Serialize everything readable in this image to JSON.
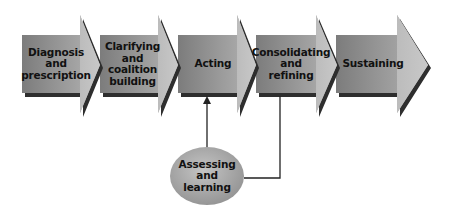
{
  "diagram": {
    "type": "process-flow",
    "stages": [
      {
        "id": "diagnosis",
        "lines": [
          "Diagnosis",
          "and",
          "prescription"
        ]
      },
      {
        "id": "clarifying",
        "lines": [
          "Clarifying",
          "and",
          "coalition",
          "building"
        ]
      },
      {
        "id": "acting",
        "lines": [
          "Acting"
        ]
      },
      {
        "id": "consolidating",
        "lines": [
          "Consolidating",
          "and",
          "refining"
        ]
      },
      {
        "id": "sustaining",
        "lines": [
          "Sustaining"
        ]
      }
    ],
    "feedback": {
      "id": "assessing",
      "lines": [
        "Assessing",
        "and",
        "learning"
      ],
      "input_from": "consolidating",
      "output_to": "acting"
    },
    "colors": {
      "body_dark": "#7a7a7a",
      "body_light": "#b8b8b8",
      "head": "#bdbdbd",
      "shadow": "#2e2e2e",
      "ellipse": "#a8a8a8",
      "connector": "#222222",
      "text": "#111111"
    }
  }
}
